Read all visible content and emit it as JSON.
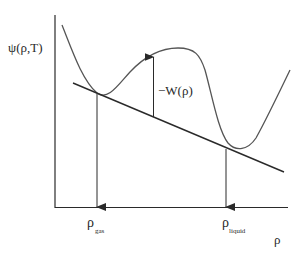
{
  "diagram": {
    "y_axis_label": "ψ(ρ,T)",
    "x_axis_label": "ρ",
    "gas_label_main": "ρ",
    "gas_label_sub": "gas",
    "liquid_label_main": "ρ",
    "liquid_label_sub": "liquid",
    "barrier_label": "−W(ρ)",
    "colors": {
      "line": "#2a2a2a",
      "curve": "#555555",
      "background": "#ffffff"
    }
  }
}
